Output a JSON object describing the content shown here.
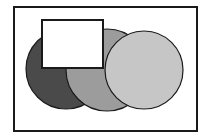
{
  "diagram": {
    "type": "overlapping-shapes",
    "frame": {
      "x": 14,
      "y": 7,
      "width": 183,
      "height": 124,
      "stroke": "#1a1a1a",
      "fill": "#ffffff"
    },
    "shapes": [
      {
        "name": "dark-circle",
        "kind": "circle",
        "cx": 66,
        "cy": 69,
        "r": 40,
        "fill": "#4a4a4a"
      },
      {
        "name": "medium-circle",
        "kind": "circle",
        "cx": 107,
        "cy": 70,
        "r": 41,
        "fill": "#9c9c9c"
      },
      {
        "name": "light-circle",
        "kind": "circle",
        "cx": 144,
        "cy": 70,
        "r": 39,
        "fill": "#c6c6c6"
      },
      {
        "name": "white-rectangle",
        "kind": "rect",
        "x": 42,
        "y": 20,
        "width": 61,
        "height": 48,
        "fill": "#ffffff"
      }
    ],
    "stroke": "#1a1a1a"
  }
}
